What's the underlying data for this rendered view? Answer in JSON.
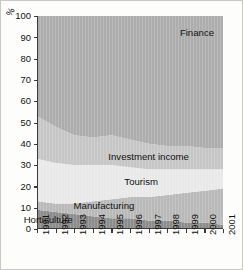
{
  "chart_data": {
    "type": "area",
    "title": "",
    "xlabel": "",
    "ylabel": "%",
    "ylim": [
      0,
      100
    ],
    "yticks": [
      0,
      10,
      20,
      30,
      40,
      50,
      60,
      70,
      80,
      90,
      100
    ],
    "grid": false,
    "legend_position": "inline-labels",
    "stacked": true,
    "x": [
      1991,
      1992,
      1993,
      1994,
      1995,
      1996,
      1997,
      1998,
      1999,
      2000,
      2001
    ],
    "categories": [
      "1991",
      "1992",
      "1993",
      "1994",
      "1995",
      "1996",
      "1997",
      "1998",
      "1999",
      "2000",
      "2001"
    ],
    "series": [
      {
        "name": "Horticulture",
        "color": "#8c8c8c",
        "values": [
          9,
          8,
          7,
          6,
          5,
          5,
          4,
          4,
          3,
          3,
          2
        ]
      },
      {
        "name": "Manufacturing",
        "color": "#b9b9b9",
        "values": [
          4,
          4,
          5,
          7,
          9,
          10,
          11,
          12,
          14,
          15,
          17
        ]
      },
      {
        "name": "Tourism",
        "color": "#e9e9e9",
        "values": [
          20,
          19,
          18,
          17,
          16,
          14,
          13,
          12,
          11,
          10,
          9
        ]
      },
      {
        "name": "Investment income",
        "color": "#c6c6c6",
        "values": [
          20,
          17,
          14,
          13,
          14,
          13,
          12,
          11,
          11,
          10,
          10
        ]
      },
      {
        "name": "Finance",
        "color": "#adadad",
        "values": [
          47,
          52,
          56,
          57,
          56,
          58,
          60,
          61,
          61,
          62,
          62
        ]
      }
    ],
    "boundaries": {
      "horticulture_top": [
        9,
        8,
        7,
        6,
        5,
        5,
        4,
        4,
        3,
        3,
        2
      ],
      "manufacturing_top": [
        13,
        12,
        12,
        13,
        14,
        15,
        15,
        16,
        17,
        18,
        19
      ],
      "tourism_top": [
        33,
        31,
        30,
        30,
        30,
        29,
        28,
        28,
        28,
        28,
        28
      ],
      "investment_income_top": [
        53,
        48,
        44,
        43,
        44,
        42,
        40,
        39,
        39,
        38,
        38
      ],
      "finance_top": [
        100,
        100,
        100,
        100,
        100,
        100,
        100,
        100,
        100,
        100,
        100
      ]
    },
    "annotations": [
      {
        "text": "Finance",
        "x": 1999.6,
        "y": 92
      },
      {
        "text": "Investment income",
        "x": 1997.0,
        "y": 34
      },
      {
        "text": "Tourism",
        "x": 1996.6,
        "y": 22
      },
      {
        "text": "Manufacturing",
        "x": 1994.6,
        "y": 11
      },
      {
        "text": "Horticulture",
        "x": 1991.6,
        "y": 4
      }
    ]
  },
  "axes": {
    "y_axis_title": "%",
    "y_tick_labels": [
      "100",
      "90",
      "80",
      "70",
      "60",
      "50",
      "40",
      "30",
      "20",
      "10",
      "0"
    ],
    "x_tick_labels": [
      "1991",
      "1992",
      "1993",
      "1994",
      "1995",
      "1996",
      "1997",
      "1998",
      "1999",
      "2000",
      "2001"
    ]
  },
  "labels": {
    "finance": "Finance",
    "investment_income": "Investment income",
    "tourism": "Tourism",
    "manufacturing": "Manufacturing",
    "horticulture": "Horticulture"
  },
  "colors": {
    "finance": "#adadad",
    "investment_income": "#c6c6c6",
    "tourism": "#e9e9e9",
    "manufacturing": "#b9b9b9",
    "horticulture": "#8c8c8c",
    "axis": "#3a3a3a",
    "text": "#111111",
    "background": "#fdfdfb"
  }
}
